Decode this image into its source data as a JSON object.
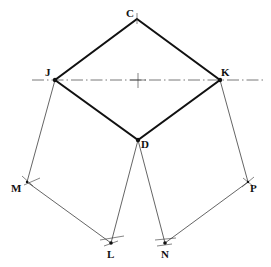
{
  "diagram": {
    "type": "geometric-construction",
    "points": {
      "C": {
        "label": "C",
        "x": 137,
        "y": 19
      },
      "J": {
        "label": "J",
        "x": 55,
        "y": 80
      },
      "K": {
        "label": "K",
        "x": 220,
        "y": 80
      },
      "D": {
        "label": "D",
        "x": 138,
        "y": 140
      },
      "M": {
        "label": "M",
        "x": 27,
        "y": 182
      },
      "P": {
        "label": "P",
        "x": 248,
        "y": 182
      },
      "L": {
        "label": "L",
        "x": 111,
        "y": 243
      },
      "N": {
        "label": "N",
        "x": 165,
        "y": 243
      }
    },
    "rhombus": [
      "C",
      "K",
      "D",
      "J"
    ],
    "thin_lines": [
      [
        "J",
        "M"
      ],
      [
        "M",
        "L"
      ],
      [
        "D",
        "L"
      ],
      [
        "D",
        "N"
      ],
      [
        "K",
        "P"
      ],
      [
        "P",
        "N"
      ]
    ],
    "centerline": {
      "style": "dash-dot",
      "x1": 32,
      "x2": 265,
      "y": 80
    },
    "center_mark": {
      "x": 138,
      "y": 80
    }
  }
}
